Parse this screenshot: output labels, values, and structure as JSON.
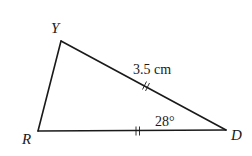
{
  "diagram": {
    "type": "triangle",
    "vertices": [
      {
        "id": "Y",
        "label": "Y"
      },
      {
        "id": "R",
        "label": "R"
      },
      {
        "id": "D",
        "label": "D"
      }
    ],
    "sides": [
      {
        "from": "Y",
        "to": "D",
        "length_label": "3.5 cm",
        "tick_marks": 2
      },
      {
        "from": "R",
        "to": "D",
        "length_label": "",
        "tick_marks": 2
      },
      {
        "from": "Y",
        "to": "R",
        "length_label": "",
        "tick_marks": 0
      }
    ],
    "angles": [
      {
        "vertex": "D",
        "label": "28°"
      }
    ],
    "labels": {
      "vertex_y": "Y",
      "vertex_r": "R",
      "vertex_d": "D",
      "side_yd": "3.5 cm",
      "angle_d": "28°"
    }
  }
}
